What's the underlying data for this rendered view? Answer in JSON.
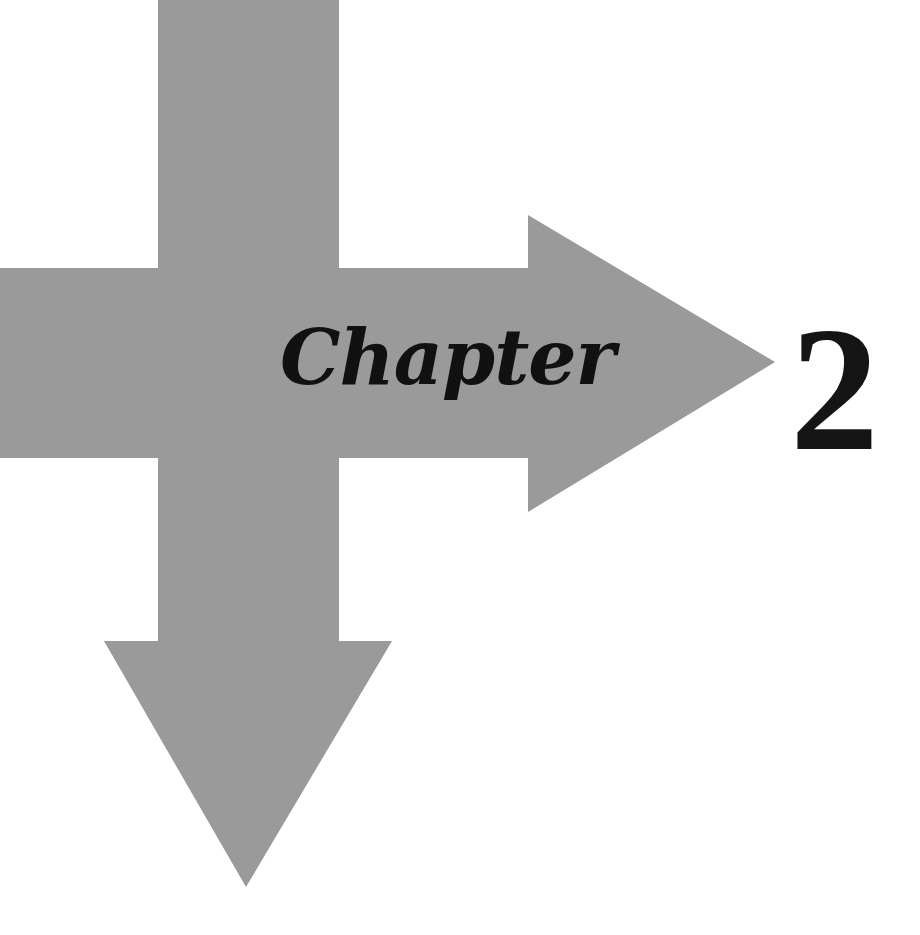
{
  "chapter": {
    "label": "Chapter",
    "number": "2"
  },
  "graphic": {
    "arrow_color": "#9a9a9a",
    "text_color": "#111111",
    "background": "#ffffff"
  }
}
